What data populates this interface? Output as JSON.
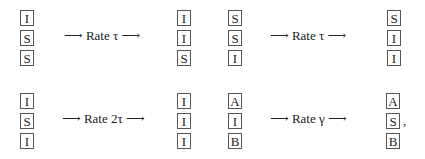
{
  "transitions": [
    {
      "from": [
        "I",
        "S",
        "S"
      ],
      "label": "⟶ Rate τ ⟶",
      "to": [
        "I",
        "I",
        "S"
      ]
    },
    {
      "from": [
        "S",
        "S",
        "I"
      ],
      "label": "⟶ Rate τ ⟶",
      "to": [
        "S",
        "I",
        "I"
      ]
    },
    {
      "from": [
        "I",
        "S",
        "I"
      ],
      "label": "⟶ Rate 2τ ⟶",
      "to": [
        "I",
        "I",
        "I"
      ]
    },
    {
      "from": [
        "A",
        "I",
        "B"
      ],
      "label": "⟶ Rate γ ⟶",
      "to": [
        "A",
        "S",
        "B"
      ]
    }
  ],
  "trailing_punctuation": ","
}
